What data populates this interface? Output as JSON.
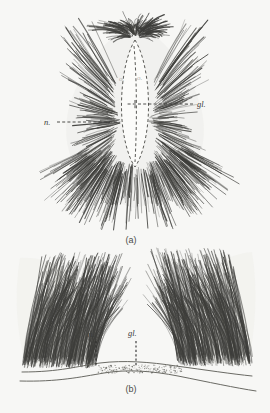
{
  "plate": {
    "background_color": "#f7f7f5",
    "ink_color": "#3a3a38",
    "width": 270,
    "height": 413
  },
  "figures": [
    {
      "id": "a",
      "caption": "(a)",
      "caption_x": 131,
      "caption_y": 243,
      "view": "dorsal view of hair-pencil / scale tuft",
      "labels": [
        {
          "key": "gl",
          "text": "gl.",
          "x": 197,
          "y": 107,
          "leader": {
            "type": "horizontal-dashed",
            "x1": 193,
            "y1": 104,
            "x2": 126,
            "y2": 104
          }
        },
        {
          "key": "n",
          "text": "n.",
          "x": 48,
          "y": 125,
          "leader": {
            "type": "horizontal-dashed",
            "x1": 57,
            "y1": 122,
            "x2": 118,
            "y2": 122
          }
        },
        {
          "key": "o1",
          "text": "o.",
          "x": 119,
          "y": 81,
          "faint": true
        },
        {
          "key": "o2",
          "text": "o.",
          "x": 137,
          "y": 80,
          "faint": true
        }
      ]
    },
    {
      "id": "b",
      "caption": "(b)",
      "caption_x": 131,
      "caption_y": 392,
      "view": "lateral section through gland and tufts",
      "labels": [
        {
          "key": "n",
          "text": "n.",
          "x": 92,
          "y": 337,
          "leader": {
            "type": "vertical-dashed",
            "x1": 96,
            "y1": 341,
            "x2": 96,
            "y2": 366
          }
        },
        {
          "key": "gl",
          "text": "gl.",
          "x": 131,
          "y": 336,
          "leader": {
            "type": "vertical-dashed",
            "x1": 136,
            "y1": 341,
            "x2": 136,
            "y2": 366
          }
        }
      ]
    }
  ],
  "legend_keys": [
    {
      "abbrev": "gl.",
      "meaning": "gland"
    },
    {
      "abbrev": "n.",
      "meaning": "nerve"
    },
    {
      "abbrev": "o.",
      "meaning": "opening"
    }
  ]
}
